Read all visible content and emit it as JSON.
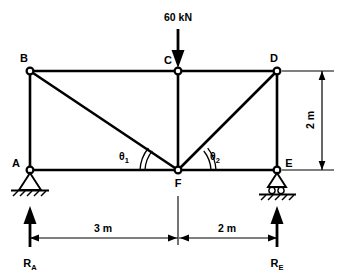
{
  "figure": {
    "type": "truss-free-body-diagram",
    "title": "",
    "stroke_color": "#000000",
    "background_color": "#ffffff"
  },
  "joints": [
    {
      "id": "B",
      "label": "B",
      "x": 30,
      "y": 71,
      "label_x": 24,
      "label_y": 62
    },
    {
      "id": "C",
      "label": "C",
      "x": 178,
      "y": 71,
      "label_x": 168,
      "label_y": 64
    },
    {
      "id": "D",
      "label": "D",
      "x": 277,
      "y": 71,
      "label_x": 274,
      "label_y": 62
    },
    {
      "id": "A",
      "label": "A",
      "x": 30,
      "y": 170,
      "label_x": 14,
      "label_y": 167
    },
    {
      "id": "F",
      "label": "F",
      "x": 178,
      "y": 170,
      "label_x": 174,
      "label_y": 186
    },
    {
      "id": "E",
      "label": "E",
      "x": 277,
      "y": 170,
      "label_x": 287,
      "label_y": 167
    }
  ],
  "members": [
    {
      "from": "B",
      "to": "C",
      "name": "top-chord-bc"
    },
    {
      "from": "C",
      "to": "D",
      "name": "top-chord-cd"
    },
    {
      "from": "A",
      "to": "F",
      "name": "bottom-chord-af"
    },
    {
      "from": "F",
      "to": "E",
      "name": "bottom-chord-fe"
    },
    {
      "from": "A",
      "to": "B",
      "name": "vertical-ab"
    },
    {
      "from": "C",
      "to": "F",
      "name": "vertical-cf"
    },
    {
      "from": "D",
      "to": "E",
      "name": "vertical-de"
    },
    {
      "from": "B",
      "to": "F",
      "name": "diagonal-bf"
    },
    {
      "from": "D",
      "to": "F",
      "name": "diagonal-df"
    }
  ],
  "load": {
    "label": "60 kN",
    "label_x": 178,
    "label_y": 22,
    "applied_at": "C",
    "direction": "down"
  },
  "angles": [
    {
      "id": "theta1",
      "symbol": "θ",
      "subscript": "1",
      "label_x": 126,
      "label_y": 160,
      "at_joint": "F"
    },
    {
      "id": "theta2",
      "symbol": "θ",
      "subscript": "2",
      "label_x": 213,
      "label_y": 160,
      "at_joint": "F"
    }
  ],
  "dimensions": {
    "horizontal": [
      {
        "label": "3 m",
        "from_x": 30,
        "to_x": 178,
        "y": 238,
        "label_x": 102,
        "label_y": 231
      },
      {
        "label": "2 m",
        "from_x": 178,
        "to_x": 277,
        "y": 238,
        "label_x": 226,
        "label_y": 231
      }
    ],
    "vertical": [
      {
        "label": "2 m",
        "x": 322,
        "from_y": 71,
        "to_y": 170,
        "label_x": 319,
        "label_y": 120
      }
    ]
  },
  "reactions": [
    {
      "label": "R",
      "subscript": "A",
      "x": 30,
      "label_x": 22,
      "label_y": 266,
      "direction": "up",
      "at_joint": "A"
    },
    {
      "label": "R",
      "subscript": "E",
      "x": 277,
      "label_x": 270,
      "label_y": 266,
      "direction": "up",
      "at_joint": "E"
    }
  ],
  "supports": [
    {
      "type": "pin",
      "at_joint": "A",
      "x": 30,
      "y": 170
    },
    {
      "type": "roller",
      "at_joint": "E",
      "x": 277,
      "y": 170
    }
  ]
}
